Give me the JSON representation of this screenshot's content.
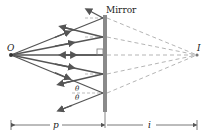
{
  "diagram": {
    "labels": {
      "mirror": "Mirror",
      "object": "O",
      "image": "I",
      "theta_upper": "θ",
      "theta_lower": "θ",
      "object_distance": "p",
      "image_distance": "i"
    },
    "colors": {
      "ray": "#555555",
      "virtual_ray": "#b0b0b0",
      "mirror": "#8a8a8a",
      "text": "#222222"
    },
    "points": {
      "object": {
        "x": 11,
        "y": 55
      },
      "image": {
        "x": 197,
        "y": 55
      },
      "mirror_x": 105,
      "mirror_top": 15,
      "mirror_bottom": 112
    },
    "ray_hit_points_y": [
      18,
      37,
      55,
      74,
      93
    ]
  }
}
